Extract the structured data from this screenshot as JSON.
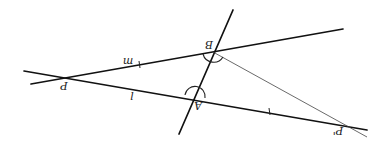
{
  "figure": {
    "orientation": "rotated 180 degrees",
    "lines": [
      {
        "name": "m",
        "label": "m",
        "through": [
          "P",
          "B"
        ]
      },
      {
        "name": "l",
        "label": "l",
        "through": [
          "P",
          "A",
          "P'"
        ]
      },
      {
        "name": "transversal",
        "label": "",
        "through": [
          "A",
          "B"
        ]
      },
      {
        "name": "segment-BP'",
        "label": "",
        "through": [
          "B",
          "P'"
        ]
      }
    ],
    "points": [
      {
        "id": "P",
        "label": "P"
      },
      {
        "id": "A",
        "label": "A"
      },
      {
        "id": "B",
        "label": "B"
      },
      {
        "id": "P'",
        "label": "P'"
      }
    ],
    "angle_marks": [
      "angle at A",
      "angle at B"
    ],
    "tick_marks": [
      "on line m between P and B",
      "on line l between A and P'"
    ]
  },
  "labels": {
    "m": "m",
    "l": "l",
    "P": "P",
    "A": "A",
    "B": "B",
    "P_prime": "P'"
  }
}
